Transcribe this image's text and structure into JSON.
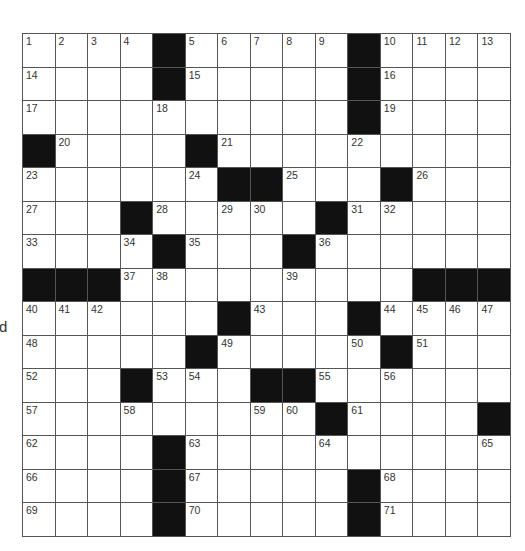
{
  "edge_fragment": "d",
  "puzzle": {
    "rows": 15,
    "cols": 15,
    "colors": {
      "block": "#111111",
      "cell": "#ffffff",
      "line": "#555555"
    },
    "grid": [
      [
        "1",
        "2",
        "3",
        "4",
        "#",
        "5",
        "6",
        "7",
        "8",
        "9",
        "#",
        "10",
        "11",
        "12",
        "13"
      ],
      [
        "14",
        "",
        "",
        "",
        "#",
        "15",
        "",
        "",
        "",
        "",
        "#",
        "16",
        "",
        "",
        ""
      ],
      [
        "17",
        "",
        "",
        "",
        "18",
        "",
        "",
        "",
        "",
        "",
        "#",
        "19",
        "",
        "",
        ""
      ],
      [
        "#",
        "20",
        "",
        "",
        "",
        "#",
        "21",
        "",
        "",
        "",
        "22",
        "",
        "",
        "",
        ""
      ],
      [
        "23",
        "",
        "",
        "",
        "",
        "24",
        "#",
        "#",
        "25",
        "",
        "",
        "#",
        "26",
        "",
        ""
      ],
      [
        "27",
        "",
        "",
        "#",
        "28",
        "",
        "29",
        "30",
        "",
        "#",
        "31",
        "32",
        "",
        "",
        ""
      ],
      [
        "33",
        "",
        "",
        "34",
        "#",
        "35",
        "",
        "",
        "#",
        "36",
        "",
        "",
        "",
        "",
        ""
      ],
      [
        "#",
        "#",
        "#",
        "37",
        "38",
        "",
        "",
        "",
        "39",
        "",
        "",
        "",
        "#",
        "#",
        "#"
      ],
      [
        "40",
        "41",
        "42",
        "",
        "",
        "",
        "#",
        "43",
        "",
        "",
        "#",
        "44",
        "45",
        "46",
        "47"
      ],
      [
        "48",
        "",
        "",
        "",
        "",
        "#",
        "49",
        "",
        "",
        "",
        "50",
        "#",
        "51",
        "",
        ""
      ],
      [
        "52",
        "",
        "",
        "#",
        "53",
        "54",
        "",
        "#",
        "#",
        "55",
        "",
        "56",
        "",
        "",
        ""
      ],
      [
        "57",
        "",
        "",
        "58",
        "",
        "",
        "",
        "59",
        "60",
        "#",
        "61",
        "",
        "",
        "",
        "#"
      ],
      [
        "62",
        "",
        "",
        "",
        "#",
        "63",
        "",
        "",
        "",
        "64",
        "",
        "",
        "",
        "",
        "65"
      ],
      [
        "66",
        "",
        "",
        "",
        "#",
        "67",
        "",
        "",
        "",
        "",
        "#",
        "68",
        "",
        "",
        ""
      ],
      [
        "69",
        "",
        "",
        "",
        "#",
        "70",
        "",
        "",
        "",
        "",
        "#",
        "71",
        "",
        "",
        ""
      ]
    ]
  }
}
